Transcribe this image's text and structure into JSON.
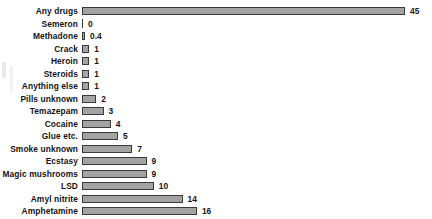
{
  "chart_data": {
    "type": "bar",
    "orientation": "horizontal",
    "title": "",
    "xlabel": "",
    "ylabel": "",
    "xlim": [
      0,
      45
    ],
    "grid": false,
    "legend": null,
    "categories": [
      "Any drugs",
      "Semeron",
      "Methadone",
      "Crack",
      "Heroin",
      "Steroids",
      "Anything else",
      "Pills unknown",
      "Temazepam",
      "Cocaine",
      "Glue etc.",
      "Smoke unknown",
      "Ecstasy",
      "Magic mushrooms",
      "LSD",
      "Amyl nitrite",
      "Amphetamine",
      "Cannabis"
    ],
    "values": [
      45,
      0,
      0.4,
      1,
      1,
      1,
      1,
      2,
      3,
      4,
      5,
      7,
      9,
      9,
      10,
      14,
      16,
      36
    ],
    "value_labels": [
      "45",
      "0",
      "0.4",
      "1",
      "1",
      "1",
      "1",
      "2",
      "3",
      "4",
      "5",
      "7",
      "9",
      "9",
      "10",
      "14",
      "16",
      "36"
    ],
    "colors": {
      "bar_fill": "#a3a3a3",
      "bar_border": "#3a3a3a",
      "text": "#141414",
      "background": "#ffffff"
    }
  }
}
